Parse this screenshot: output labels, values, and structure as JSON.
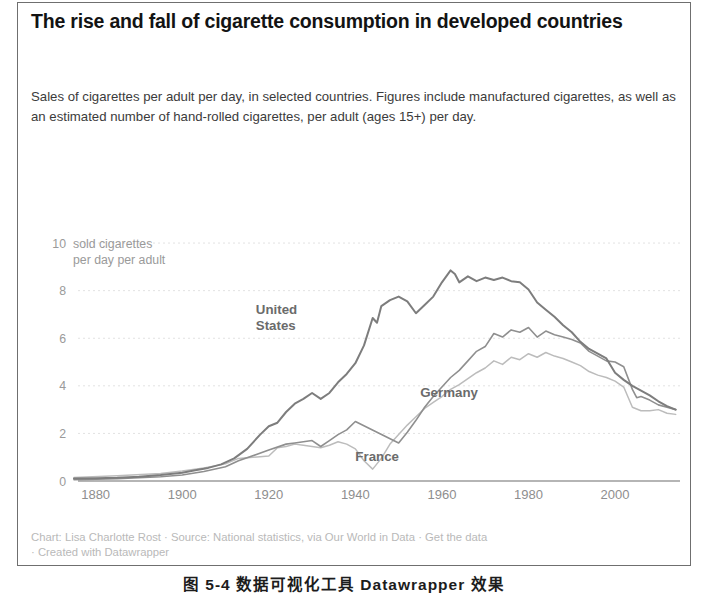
{
  "card": {
    "title": "The rise and fall of cigarette consumption in developed countries",
    "subtitle": "Sales of cigarettes per adult per day, in selected countries. Figures include manufactured cigarettes, as well as an estimated number of hand-rolled cigarettes, per adult (ages 15+) per day.",
    "footer_line1": "Chart: Lisa Charlotte Rost · Source: National statistics, via Our World in Data · Get the data",
    "footer_line2": "· Created with Datawrapper"
  },
  "caption": {
    "text": "图 5-4   数据可视化工具 Datawrapper 效果"
  },
  "colors": {
    "united_states": "#7d7d7d",
    "germany": "#8f8f8f",
    "france": "#bcbcbc",
    "gridline": "#e2e2e2",
    "axis": "#6d6d6d",
    "tick_text": "#9a9a9a",
    "title": "#131313",
    "subtitle": "#3b3b3b",
    "footer": "#b9b9b9",
    "card_border": "#6f6f6f"
  },
  "chart_data": {
    "type": "line",
    "title": "The rise and fall of cigarette consumption in developed countries",
    "subtitle": "Sales of cigarettes per adult per day, in selected countries. Figures include manufactured cigarettes, as well as an estimated number of hand-rolled cigarettes, per adult (ages 15+) per day.",
    "xlabel": "",
    "ylabel": "sold cigarettes per day per adult",
    "axis_note_line1": "sold cigarettes",
    "axis_note_line2": "per day per adult",
    "xlim": [
      1875,
      2015
    ],
    "ylim": [
      0,
      11.6
    ],
    "xticks": [
      1880,
      1900,
      1920,
      1940,
      1960,
      1980,
      2000
    ],
    "yticks": [
      0,
      2,
      4,
      6,
      8,
      10
    ],
    "grid": true,
    "legend": "inline-labels",
    "series": [
      {
        "name": "United States",
        "color": "#7d7d7d",
        "label_x": 1917,
        "label_y": 7.0,
        "x": [
          1875,
          1880,
          1885,
          1890,
          1895,
          1900,
          1903,
          1906,
          1909,
          1912,
          1915,
          1918,
          1920,
          1922,
          1924,
          1926,
          1928,
          1930,
          1932,
          1934,
          1936,
          1938,
          1940,
          1942,
          1944,
          1945,
          1946,
          1948,
          1950,
          1952,
          1954,
          1956,
          1958,
          1960,
          1962,
          1963,
          1964,
          1966,
          1968,
          1970,
          1972,
          1974,
          1976,
          1978,
          1980,
          1982,
          1984,
          1986,
          1988,
          1990,
          1992,
          1994,
          1996,
          1998,
          2000,
          2002,
          2004,
          2006,
          2008,
          2010,
          2012,
          2014
        ],
        "y": [
          0.1,
          0.12,
          0.14,
          0.18,
          0.25,
          0.35,
          0.45,
          0.55,
          0.7,
          0.95,
          1.35,
          1.95,
          2.3,
          2.45,
          2.9,
          3.25,
          3.45,
          3.7,
          3.45,
          3.7,
          4.15,
          4.5,
          4.95,
          5.7,
          6.85,
          6.65,
          7.35,
          7.6,
          7.75,
          7.55,
          7.05,
          7.4,
          7.75,
          8.35,
          8.85,
          8.7,
          8.35,
          8.6,
          8.4,
          8.55,
          8.45,
          8.55,
          8.4,
          8.35,
          8.05,
          7.5,
          7.2,
          6.9,
          6.55,
          6.25,
          5.85,
          5.55,
          5.35,
          5.15,
          4.55,
          4.25,
          4.0,
          3.8,
          3.6,
          3.35,
          3.15,
          3.0
        ]
      },
      {
        "name": "Germany",
        "color": "#8f8f8f",
        "label_x": 1955,
        "label_y": 3.55,
        "x": [
          1875,
          1885,
          1895,
          1900,
          1905,
          1910,
          1913,
          1920,
          1924,
          1926,
          1928,
          1930,
          1932,
          1934,
          1936,
          1938,
          1940,
          1950,
          1952,
          1954,
          1956,
          1958,
          1960,
          1962,
          1964,
          1966,
          1968,
          1970,
          1972,
          1974,
          1976,
          1978,
          1980,
          1982,
          1984,
          1986,
          1988,
          1990,
          1992,
          1994,
          1996,
          1998,
          2000,
          2002,
          2004,
          2005,
          2006,
          2008,
          2010,
          2012,
          2014
        ],
        "y": [
          0.05,
          0.1,
          0.18,
          0.25,
          0.4,
          0.6,
          0.85,
          1.3,
          1.55,
          1.6,
          1.65,
          1.7,
          1.45,
          1.7,
          1.95,
          2.15,
          2.5,
          1.6,
          2.05,
          2.55,
          3.1,
          3.55,
          3.95,
          4.35,
          4.65,
          5.05,
          5.45,
          5.65,
          6.2,
          6.05,
          6.35,
          6.25,
          6.45,
          6.05,
          6.3,
          6.15,
          6.05,
          5.95,
          5.8,
          5.45,
          5.25,
          5.05,
          5.0,
          4.8,
          3.85,
          3.5,
          3.55,
          3.4,
          3.2,
          3.1,
          3.0
        ]
      },
      {
        "name": "France",
        "color": "#bcbcbc",
        "label_x": 1940,
        "label_y": 0.85,
        "x": [
          1875,
          1885,
          1895,
          1900,
          1905,
          1910,
          1913,
          1920,
          1922,
          1924,
          1926,
          1928,
          1930,
          1932,
          1934,
          1936,
          1938,
          1940,
          1942,
          1944,
          1946,
          1948,
          1950,
          1952,
          1954,
          1956,
          1958,
          1960,
          1962,
          1964,
          1966,
          1968,
          1970,
          1972,
          1974,
          1976,
          1978,
          1980,
          1982,
          1984,
          1986,
          1988,
          1990,
          1992,
          1994,
          1996,
          1998,
          2000,
          2002,
          2004,
          2006,
          2008,
          2010,
          2012,
          2014
        ],
        "y": [
          0.15,
          0.22,
          0.32,
          0.42,
          0.55,
          0.72,
          0.95,
          1.05,
          1.4,
          1.45,
          1.55,
          1.5,
          1.45,
          1.4,
          1.5,
          1.65,
          1.55,
          1.35,
          0.85,
          0.5,
          0.95,
          1.55,
          1.95,
          2.35,
          2.7,
          3.05,
          3.3,
          3.55,
          3.85,
          4.05,
          4.3,
          4.55,
          4.75,
          5.05,
          4.9,
          5.2,
          5.1,
          5.35,
          5.2,
          5.4,
          5.25,
          5.15,
          5.0,
          4.85,
          4.6,
          4.45,
          4.35,
          4.2,
          3.95,
          3.1,
          2.95,
          2.95,
          3.0,
          2.85,
          2.8
        ]
      }
    ]
  }
}
